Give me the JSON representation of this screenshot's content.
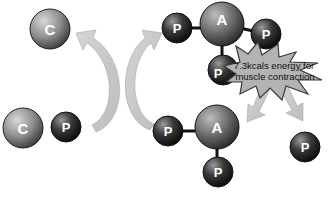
{
  "diagram": {
    "molecules": {
      "creatine_top": {
        "label": "C"
      },
      "creatine_bottom": {
        "label": "C"
      },
      "creatine_phosphate": {
        "label": "P"
      },
      "atp_top": {
        "adenosine": "A",
        "phosphates": [
          "P",
          "P",
          "P"
        ]
      },
      "adp_bottom": {
        "adenosine": "A",
        "phosphates": [
          "P",
          "P"
        ]
      },
      "free_phosphate": {
        "label": "P"
      }
    },
    "energy_burst": {
      "line1": "7.3kcals energy for",
      "line2": "muscle contraction"
    }
  },
  "colors": {
    "arrow": "#c8c8c8",
    "burst_fill": "#b5b5b5",
    "creatine_sphere": "#8a8a8a",
    "phosphate_sphere": "#2a2a2a",
    "bond": "#111111"
  }
}
